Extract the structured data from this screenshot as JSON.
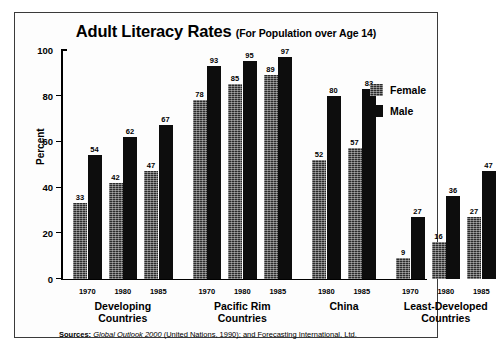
{
  "chart_data": {
    "type": "bar",
    "title": "Adult Literacy Rates",
    "subtitle": "(For Population over Age 14)",
    "xlabel": "",
    "ylabel": "Percent",
    "ylim": [
      0,
      100
    ],
    "yticks": [
      0,
      20,
      40,
      60,
      80,
      100
    ],
    "grid": false,
    "legend_position": "top-right",
    "legend": [
      "Female",
      "Male"
    ],
    "groups": [
      {
        "name": "Developing Countries",
        "name_line1": "Developing",
        "name_line2": "Countries",
        "categories": [
          "1970",
          "1980",
          "1985"
        ],
        "female": [
          33,
          42,
          47
        ],
        "male": [
          54,
          62,
          67
        ]
      },
      {
        "name": "Pacific Rim Countries",
        "name_line1": "Pacific Rim",
        "name_line2": "Countries",
        "categories": [
          "1970",
          "1980",
          "1985"
        ],
        "female": [
          78,
          85,
          89
        ],
        "male": [
          93,
          95,
          97
        ]
      },
      {
        "name": "China",
        "name_line1": "China",
        "name_line2": "",
        "categories": [
          "1980",
          "1985"
        ],
        "female": [
          52,
          57
        ],
        "male": [
          80,
          83
        ]
      },
      {
        "name": "Least-Developed Countries",
        "name_line1": "Least-Developed",
        "name_line2": "Countries",
        "categories": [
          "1970",
          "1980",
          "1985"
        ],
        "female": [
          9,
          16,
          27
        ],
        "male": [
          27,
          36,
          47
        ]
      }
    ],
    "series": [
      {
        "name": "Female",
        "values": [
          33,
          42,
          47,
          78,
          85,
          89,
          52,
          57,
          9,
          16,
          27
        ]
      },
      {
        "name": "Male",
        "values": [
          54,
          62,
          67,
          93,
          95,
          97,
          80,
          83,
          27,
          36,
          47
        ]
      }
    ],
    "colors": {
      "female": "#2b2b2b",
      "male": "#0d0d0d",
      "axis": "#000000",
      "frame": "#3a3a3a",
      "background": "#fdfdfd"
    }
  },
  "source": {
    "label": "Sources:",
    "italic_part": "Global Outlook 2000",
    "rest": "(United Nations, 1990); and Forecasting International, Ltd."
  }
}
